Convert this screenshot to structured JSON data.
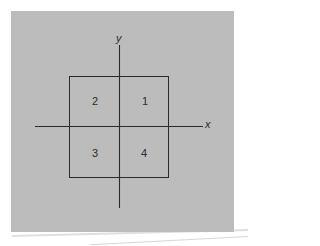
{
  "figure": {
    "background_color": "#bcbcbc",
    "line_color": "#2a2a2a",
    "axes": {
      "x_label": "x",
      "y_label": "y"
    },
    "quadrants": [
      {
        "id": "q1",
        "label": "1",
        "position": "upper-right"
      },
      {
        "id": "q2",
        "label": "2",
        "position": "upper-left"
      },
      {
        "id": "q3",
        "label": "3",
        "position": "lower-left"
      },
      {
        "id": "q4",
        "label": "4",
        "position": "lower-right"
      }
    ]
  }
}
